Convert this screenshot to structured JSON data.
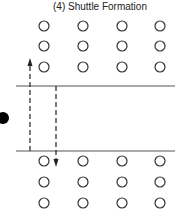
{
  "title": "(4)  Shuttle Formation",
  "diagram": {
    "type": "formation",
    "top_group": {
      "rows": 3,
      "cols": 4
    },
    "bottom_group": {
      "rows": 3,
      "cols": 4
    },
    "lines": [
      "top-boundary",
      "bottom-boundary"
    ],
    "arrows": [
      {
        "name": "up-dashed-arrow",
        "direction": "up"
      },
      {
        "name": "down-dashed-arrow",
        "direction": "down"
      }
    ],
    "marker": "filled-dot"
  }
}
